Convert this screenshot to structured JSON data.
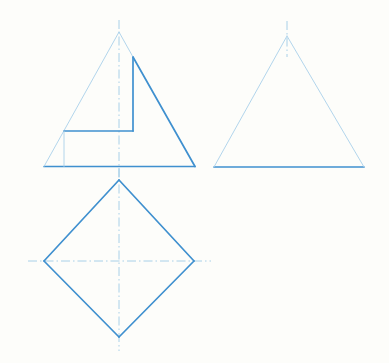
{
  "document": {
    "title": "Orthographic Projection Drawing",
    "background_color": "#fdfdfa",
    "width": 389,
    "height": 363
  },
  "styles": {
    "object_line_color": "#3f90cf",
    "object_line_width": 1.7,
    "construction_line_color": "#a9d0ea",
    "construction_line_width": 0.9,
    "center_line_color": "#9ecbe6",
    "center_line_width": 0.9,
    "center_line_dash": "9 3 1.5 3"
  },
  "views": {
    "front_view": {
      "name": "Front View",
      "label": "front-view-stepped-triangle",
      "outline": {
        "apex": {
          "x": 119,
          "y": 32
        },
        "base_left": {
          "x": 44,
          "y": 166.5
        },
        "base_right": {
          "x": 195,
          "y": 166.5
        }
      },
      "segments": [
        {
          "name": "base-line",
          "type": "object",
          "points": "44,166.5 195,166.5"
        },
        {
          "name": "right-slope-lower",
          "type": "object",
          "points": "195,166.5 133,57"
        },
        {
          "name": "left-slope",
          "type": "construction",
          "points": "44,166.5 119,32"
        },
        {
          "name": "right-slope-upper",
          "type": "construction",
          "points": "119,32 133,57"
        },
        {
          "name": "step-vertical",
          "type": "object",
          "points": "133,57 133,131"
        },
        {
          "name": "step-horizontal",
          "type": "object",
          "points": "133,131 64,131"
        },
        {
          "name": "step-left-edge",
          "type": "construction",
          "points": "64,131 64,166.5"
        }
      ],
      "center_lines": [
        {
          "name": "vertical-center-line",
          "x1": 119,
          "y1": 20,
          "x2": 119,
          "y2": 180
        }
      ]
    },
    "side_view": {
      "name": "Side View",
      "label": "side-view-triangle",
      "outline": {
        "apex": {
          "x": 287,
          "y": 36
        },
        "base_left": {
          "x": 214,
          "y": 167
        },
        "base_right": {
          "x": 364,
          "y": 167
        }
      },
      "segments": [
        {
          "name": "base-line",
          "type": "object",
          "points": "214,167 364,167"
        },
        {
          "name": "left-slope",
          "type": "construction",
          "points": "214,167 287,36"
        },
        {
          "name": "right-slope",
          "type": "construction",
          "points": "287,36 364,167"
        }
      ],
      "center_lines": [
        {
          "name": "vertical-center-line",
          "x1": 287,
          "y1": 21,
          "x2": 287,
          "y2": 57
        }
      ]
    },
    "top_view": {
      "name": "Top View",
      "label": "top-view-diamond",
      "outline": {
        "top": {
          "x": 119,
          "y": 180
        },
        "left": {
          "x": 44,
          "y": 261
        },
        "right": {
          "x": 194,
          "y": 261
        },
        "bottom": {
          "x": 119,
          "y": 337
        }
      },
      "segments": [
        {
          "name": "upper-left-edge",
          "type": "object",
          "points": "119,180 44,261"
        },
        {
          "name": "lower-left-edge",
          "type": "object",
          "points": "44,261 119,337"
        },
        {
          "name": "lower-right-edge",
          "type": "object",
          "points": "119,337 194,261"
        },
        {
          "name": "upper-right-edge",
          "type": "object",
          "points": "194,261 119,180"
        }
      ],
      "center_lines": [
        {
          "name": "vertical-center-line",
          "x1": 119,
          "y1": 168,
          "x2": 119,
          "y2": 351
        },
        {
          "name": "horizontal-center-line",
          "x1": 28,
          "y1": 261,
          "x2": 211,
          "y2": 261
        }
      ]
    }
  }
}
